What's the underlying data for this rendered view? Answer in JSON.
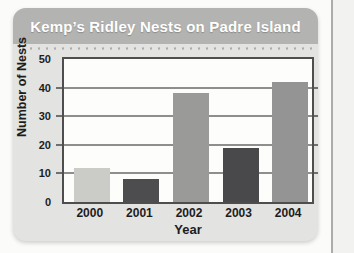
{
  "chart_data": {
    "type": "bar",
    "title": "Kemp’s Ridley Nests on Padre Island",
    "categories": [
      "2000",
      "2001",
      "2002",
      "2003",
      "2004"
    ],
    "values": [
      12,
      8,
      38,
      19,
      42
    ],
    "xlabel": "Year",
    "ylabel": "Number of Nests",
    "ylim": [
      0,
      50
    ],
    "yticks": [
      0,
      10,
      20,
      30,
      40,
      50
    ],
    "grid": true,
    "legend": false,
    "bar_colors": [
      "#cbcbc8",
      "#4d4d4f",
      "#9a9a98",
      "#49494b",
      "#949494"
    ]
  },
  "colors": {
    "title_bar_bg": "#b3b3b1",
    "title_text": "#ffffff",
    "card_bg": "#e3e3e1",
    "plot_bg": "#fdfdfc",
    "frame_border": "#4e4e4e",
    "gridline": "#8e8e8c",
    "label_text": "#1d1d1d"
  }
}
